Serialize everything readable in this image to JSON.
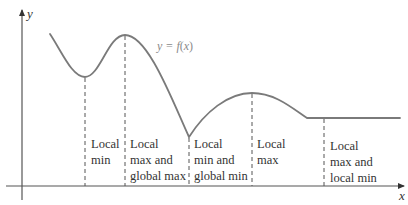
{
  "diagram": {
    "axes": {
      "x_label": "x",
      "y_label": "y"
    },
    "function_label": {
      "prefix": "y = ",
      "func": "f",
      "paren_open": "(",
      "var": "x",
      "paren_close": ")"
    },
    "regions": [
      {
        "lines": [
          "Local",
          "min"
        ]
      },
      {
        "lines": [
          "Local",
          "max and",
          "global max"
        ]
      },
      {
        "lines": [
          "Local",
          "min and",
          "global min"
        ]
      },
      {
        "lines": [
          "Local",
          "max"
        ]
      },
      {
        "lines": [
          "Local",
          "max and",
          "local min"
        ]
      }
    ],
    "colors": {
      "curve": "#7a7a7a",
      "axis": "#555555",
      "text": "#333333",
      "function_label": "#8a8a8a"
    }
  }
}
